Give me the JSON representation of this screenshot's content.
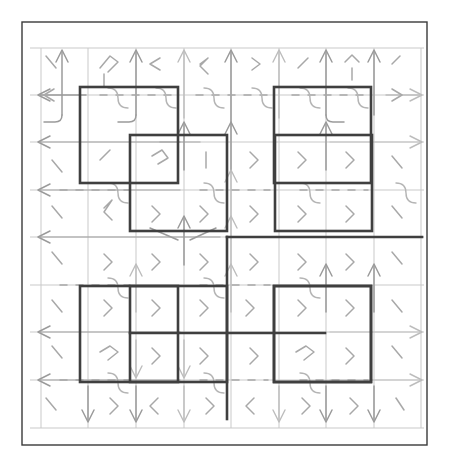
{
  "figure": {
    "title": "",
    "type": "grid-vector-field-with-walls",
    "background_color": "#ffffff",
    "frame": {
      "color": "#3a3a3a",
      "x": 22,
      "y": 22,
      "width": 405,
      "height": 423,
      "stroke_width": 1.4
    },
    "grid": {
      "color": "#c9c9c9",
      "origin_x": 41,
      "origin_y": 48,
      "cell_size": 47.5,
      "cols": 8,
      "rows": 8,
      "visible": true
    },
    "palette": {
      "arrow_light": "#bdbdbd",
      "arrow_mid": "#9b9b9b",
      "arrow_dark": "#7e7e7e",
      "curve": "#b5b5b5",
      "wall": "#3f3f3f",
      "frame": "#3a3a3a",
      "background": "#ffffff"
    },
    "walls": {
      "label": "obstacle-rectangles",
      "stroke_width": 2.6,
      "rects": [
        {
          "name": "wall-top-left",
          "x": 80,
          "y": 87,
          "width": 98,
          "height": 96
        },
        {
          "name": "wall-top-right",
          "x": 274,
          "y": 87,
          "width": 97,
          "height": 96
        },
        {
          "name": "wall-mid-left",
          "x": 130,
          "y": 135,
          "width": 97,
          "height": 96
        },
        {
          "name": "wall-mid-right",
          "x": 275,
          "y": 135,
          "width": 97,
          "height": 96
        },
        {
          "name": "wall-bottom-left",
          "x": 80,
          "y": 286,
          "width": 98,
          "height": 96
        },
        {
          "name": "wall-bottom-right",
          "x": 274,
          "y": 286,
          "width": 97,
          "height": 96
        },
        {
          "name": "wall-bl-inner",
          "x": 130,
          "y": 286,
          "width": 97,
          "height": 96
        },
        {
          "name": "wall-br-inner",
          "x": 274,
          "y": 286,
          "width": 97,
          "height": 96
        }
      ],
      "polylines": [
        {
          "name": "wall-center-spine",
          "points": "227,237 227,419"
        },
        {
          "name": "wall-right-rail",
          "points": "227,237 422,237"
        },
        {
          "name": "wall-bottom-rail",
          "points": "130,333 325,333"
        }
      ]
    },
    "field": {
      "description": "arrow glyphs at grid vertices",
      "directions": [
        "up",
        "down",
        "left",
        "right"
      ]
    }
  }
}
